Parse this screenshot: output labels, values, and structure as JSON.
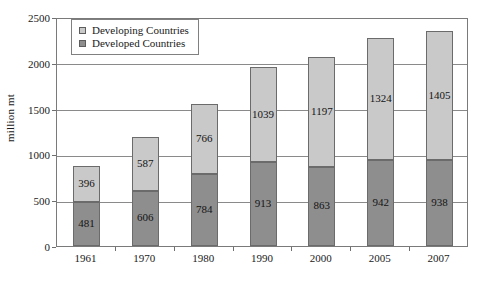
{
  "chart_data": {
    "type": "bar",
    "stacked": true,
    "title": "",
    "xlabel": "",
    "ylabel": "million mt",
    "ylim": [
      0,
      2500
    ],
    "yticks": [
      0,
      500,
      1000,
      1500,
      2000,
      2500
    ],
    "grid": true,
    "legend_position": "top-left",
    "categories": [
      "1961",
      "1970",
      "1980",
      "1990",
      "2000",
      "2005",
      "2007"
    ],
    "series": [
      {
        "name": "Developed Countries",
        "color": "#8e8e8e",
        "values": [
          481,
          606,
          784,
          913,
          863,
          942,
          938
        ]
      },
      {
        "name": "Developing Countries",
        "color": "#c9c9c9",
        "values": [
          396,
          587,
          766,
          1039,
          1197,
          1324,
          1405
        ]
      }
    ],
    "totals": [
      877,
      1193,
      1550,
      1952,
      2060,
      2266,
      2343
    ]
  },
  "axis": {
    "y_title": "million mt",
    "y_tick_labels": [
      "0",
      "500",
      "1000",
      "1500",
      "2000",
      "2500"
    ],
    "x_tick_labels": [
      "1961",
      "1970",
      "1980",
      "1990",
      "2000",
      "2005",
      "2007"
    ]
  },
  "legend": {
    "entries": [
      {
        "label": "Developing Countries",
        "swatch": "legend-swatch-developing"
      },
      {
        "label": "Developed Countries",
        "swatch": "legend-swatch-developed"
      }
    ]
  },
  "data_labels": {
    "developing": [
      "396",
      "587",
      "766",
      "1039",
      "1197",
      "1324",
      "1405"
    ],
    "developed": [
      "481",
      "606",
      "784",
      "913",
      "863",
      "942",
      "938"
    ]
  }
}
